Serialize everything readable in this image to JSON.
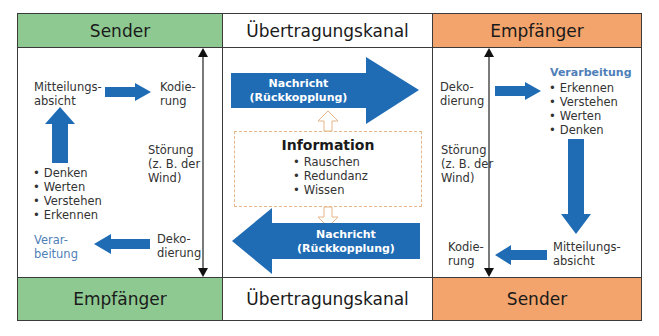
{
  "header": {
    "left": "Sender",
    "center": "Übertragungskanal",
    "right": "Empfänger"
  },
  "footer": {
    "left": "Empfänger",
    "center": "Übertragungskanal",
    "right": "Sender"
  },
  "colors": {
    "sender_green": "#8fc992",
    "receiver_orange": "#f2a46c",
    "arrow_blue": "#1f6cb5",
    "info_border": "#e7b58a",
    "processing_text_blue": "#4f7fb8"
  },
  "left_panel": {
    "intent": "Mitteilungs-\nabsicht",
    "encoding": "Kodie-\nrung",
    "noise": "Störung\n(z. B. der\nWind)",
    "steps": [
      "Denken",
      "Werten",
      "Verstehen",
      "Erkennen"
    ],
    "processing": "Verar-\nbeitung",
    "decoding": "Deko-\ndierung"
  },
  "center_panel": {
    "arrow_top_label": "Nachricht\n(Rückkopplung)",
    "arrow_bottom_label": "Nachricht\n(Rückkopplung)",
    "info_title": "Information",
    "info_items": [
      "Rauschen",
      "Redundanz",
      "Wissen"
    ]
  },
  "right_panel": {
    "decoding": "Deko-\ndierung",
    "noise": "Störung\n(z. B. der\nWind)",
    "processing_title": "Verarbeitung",
    "steps": [
      "Erkennen",
      "Verstehen",
      "Werten",
      "Denken"
    ],
    "encoding": "Kodie-\nrung",
    "intent": "Mitteilungs-\nabsicht"
  }
}
